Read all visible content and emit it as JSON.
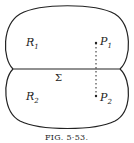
{
  "figure": {
    "caption": "FIG. 5·53.",
    "regions": [
      {
        "name": "R",
        "sub": "1"
      },
      {
        "name": "R",
        "sub": "2"
      }
    ],
    "points": [
      {
        "name": "P",
        "sub": "1"
      },
      {
        "name": "P",
        "sub": "2"
      }
    ],
    "surface_label": "Σ"
  }
}
